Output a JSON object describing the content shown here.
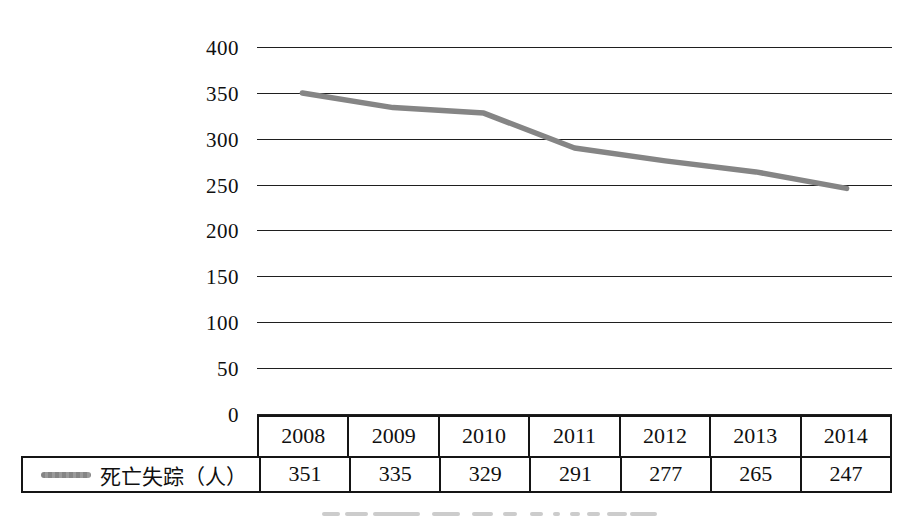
{
  "chart_data": {
    "type": "line",
    "title": "",
    "categories": [
      "2008",
      "2009",
      "2010",
      "2011",
      "2012",
      "2013",
      "2014"
    ],
    "series": [
      {
        "name": "死亡失踪（人）",
        "values": [
          351,
          335,
          329,
          291,
          277,
          265,
          247
        ]
      }
    ],
    "y_ticks": [
      "400",
      "350",
      "300",
      "250",
      "200",
      "150",
      "100",
      "50",
      "0"
    ],
    "ylim": [
      0,
      400
    ],
    "y_tick_step": 50,
    "xlabel": "",
    "ylabel": "",
    "grid": "horizontal",
    "legend_position": "data-table-left"
  },
  "colors": {
    "series_line": "#858585",
    "gridline": "#1f1f1f",
    "table_border": "#151515",
    "text": "#101010",
    "caption_fragment": "#cccccc"
  }
}
